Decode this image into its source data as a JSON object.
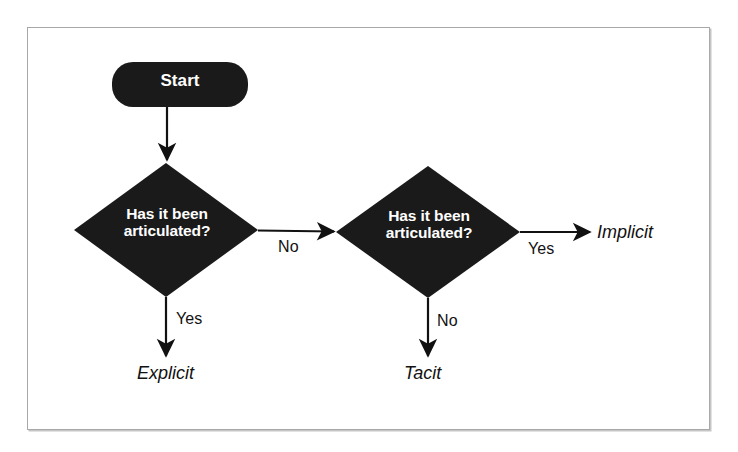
{
  "figure": {
    "type": "flowchart",
    "frame_color": "#a8a8a8",
    "background_color": "#ffffff",
    "node_fill_color": "#1a1a1a",
    "node_text_color": "#ffffff",
    "edge_color": "#111111"
  },
  "nodes": {
    "start": {
      "id": "start",
      "shape": "rounded-rectangle",
      "label": "Start"
    },
    "decision_1": {
      "id": "decision-1",
      "shape": "diamond",
      "label": "Has it been\narticulated?",
      "line_1": "Has it been",
      "line_2": "articulated?"
    },
    "decision_2": {
      "id": "decision-2",
      "shape": "diamond",
      "label": "Has it been\narticulated?",
      "line_1": "Has it been",
      "line_2": "articulated?"
    }
  },
  "outcomes": {
    "explicit": "Explicit",
    "tacit": "Tacit",
    "implicit": "Implicit"
  },
  "edges": {
    "start_to_decision_1": {
      "from": "start",
      "to": "decision-1",
      "label": "",
      "direction": "down"
    },
    "decision_1_no": {
      "from": "decision-1",
      "to": "decision-2",
      "label": "No",
      "direction": "right"
    },
    "decision_1_yes": {
      "from": "decision-1",
      "to": "Explicit",
      "label": "Yes",
      "direction": "down"
    },
    "decision_2_yes": {
      "from": "decision-2",
      "to": "Implicit",
      "label": "Yes",
      "direction": "right"
    },
    "decision_2_no": {
      "from": "decision-2",
      "to": "Tacit",
      "label": "No",
      "direction": "down"
    }
  }
}
